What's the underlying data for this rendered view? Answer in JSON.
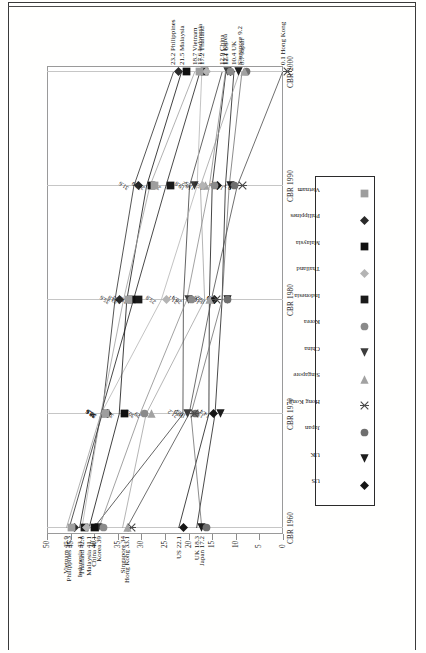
{
  "chart_data": {
    "type": "line",
    "title": "",
    "xlabel": "",
    "ylabel": "",
    "x": [
      "CBR 1960",
      "CBR 1970",
      "CBR 1980",
      "CBR 1990",
      "CBR 2000"
    ],
    "categories": [
      "CBR 1960",
      "CBR 1970",
      "CBR 1980",
      "CBR 1990",
      "CBR 2000"
    ],
    "ylim": [
      0,
      50
    ],
    "yticks": [
      "0",
      "5",
      "10",
      "15",
      "20",
      "25",
      "30",
      "35",
      "40",
      "45",
      "50"
    ],
    "grid": "vertical",
    "legend_position": "bottom-center",
    "series": [
      {
        "name": "US",
        "marker": "diamond",
        "color": "#161616",
        "values": [
          22.1,
          15.7,
          15.6,
          15.0,
          12.1
        ]
      },
      {
        "name": "UK",
        "marker": "triangle-left",
        "color": "#1d1d1d",
        "values": [
          18.3,
          14.4,
          12.9,
          12.2,
          10.4
        ]
      },
      {
        "name": "Japan",
        "marker": "circle",
        "color": "#6f6f6f",
        "values": [
          17.2,
          19.5,
          12.9,
          11.4,
          8.7
        ]
      },
      {
        "name": "Hong Kong",
        "marker": "x",
        "color": "#4a4a4a",
        "values": [
          33.1,
          19.9,
          15.2,
          9.7,
          0.1
        ]
      },
      {
        "name": "Singapore",
        "marker": "triangle-right",
        "color": "#a2a2a2",
        "values": [
          34.0,
          29.0,
          16.6,
          17.5,
          9.2
        ]
      },
      {
        "name": "China",
        "marker": "triangle-left",
        "color": "#3c3c3c",
        "values": [
          40.1,
          21.2,
          21.1,
          19.8,
          12.9
        ]
      },
      {
        "name": "Korea",
        "marker": "circle",
        "color": "#8a8a8a",
        "values": [
          39.0,
          30.3,
          20.4,
          15.6,
          12.2
        ]
      },
      {
        "name": "Indonesia",
        "marker": "square",
        "color": "#1a1a1a",
        "values": [
          43.1,
          38.6,
          31.7,
          24.8,
          17.6
        ]
      },
      {
        "name": "Thailand",
        "marker": "diamond",
        "color": "#b4b4b4",
        "values": [
          42.6,
          38.6,
          25.8,
          18.2,
          17.2
        ]
      },
      {
        "name": "Malaysia",
        "marker": "square",
        "color": "#101010",
        "values": [
          41.1,
          34.7,
          33.1,
          28.9,
          21.5
        ]
      },
      {
        "name": "Philippines",
        "marker": "diamond",
        "color": "#2a2a2a",
        "values": [
          45.3,
          38.3,
          35.6,
          31.6,
          23.2
        ]
      },
      {
        "name": "Vietnam",
        "marker": "square",
        "color": "#9e9e9e",
        "values": [
          45.9,
          38.6,
          33.8,
          28.2,
          18.7
        ]
      }
    ],
    "point_labels_1960": [
      {
        "text": "Vietnam 45.9",
        "series": "Vietnam"
      },
      {
        "text": "Philippines 45.3",
        "series": "Philippines"
      },
      {
        "text": "Indonesia 43.1",
        "series": "Indonesia"
      },
      {
        "text": "Thailand 42.6",
        "series": "Thailand"
      },
      {
        "text": "Malaysia 41.1",
        "series": "Malaysia"
      },
      {
        "text": "China 40.1",
        "series": "China"
      },
      {
        "text": "Korea 39",
        "series": "Korea"
      },
      {
        "text": "Singapore 34",
        "series": "Singapore"
      },
      {
        "text": "Hong Kong 33.1",
        "series": "Hong Kong"
      },
      {
        "text": "US 22.1",
        "series": "US"
      },
      {
        "text": "UK 18.3",
        "series": "UK"
      },
      {
        "text": "Japan 17.2",
        "series": "Japan"
      }
    ],
    "point_labels_1970": [
      "38.3",
      "38.6",
      "34.7",
      "34.0",
      "30.3",
      "29",
      "28.6",
      "21.2",
      "19.9",
      "19.5",
      "15.7",
      "14.4"
    ],
    "point_labels_1980": [
      "35.6",
      "33.8",
      "33.1",
      "31.7",
      "25.8",
      "21.1",
      "20.4",
      "16.6",
      "15.7",
      "15.6",
      "12.9",
      "12.9"
    ],
    "point_labels_1990": [
      "31.6",
      "28.9",
      "28.2",
      "24.8",
      "19.8",
      "18.2",
      "17.5",
      "15.7",
      "15.6",
      "13.2",
      "11.4",
      "9.7"
    ],
    "point_labels_2000": [
      {
        "text": "23.2 Philippines"
      },
      {
        "text": "21.5 Malaysia"
      },
      {
        "text": "18.7 Vietnam"
      },
      {
        "text": "17.2 Thailand"
      },
      {
        "text": "17.6 Indonesia"
      },
      {
        "text": "12.9 China"
      },
      {
        "text": "12.2 Korea"
      },
      {
        "text": "12.1 US"
      },
      {
        "text": "10.4 UK"
      },
      {
        "text": "8.7 Japan"
      },
      {
        "text": "Singapore 9.2"
      },
      {
        "text": "0.1 Hong Kong"
      }
    ]
  },
  "legend": {
    "items": [
      "US",
      "UK",
      "Japan",
      "Hong Kong",
      "Singapore",
      "China",
      "Korea",
      "Indonesia",
      "Thailand",
      "Malaysia",
      "Philippines",
      "Vietnam"
    ]
  },
  "axis": {
    "x_labels": [
      "CBR 1960",
      "CBR 1970",
      "CBR 1980",
      "CBR 1990",
      "CBR 2000"
    ],
    "y_labels": [
      "50",
      "45",
      "40",
      "35",
      "30",
      "25",
      "20",
      "15",
      "10",
      "5",
      "0"
    ]
  }
}
